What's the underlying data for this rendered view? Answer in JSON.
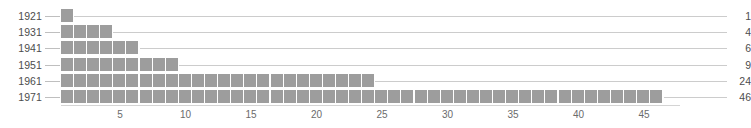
{
  "chart_data": {
    "type": "bar",
    "title": "",
    "subtitle": "",
    "xlabel": "",
    "ylabel": "",
    "orientation": "horizontal",
    "unit_square_chart": true,
    "categories": [
      "1921",
      "1931",
      "1941",
      "1951",
      "1961",
      "1971"
    ],
    "values": [
      1,
      4,
      6,
      9,
      24,
      46
    ],
    "value_labels": [
      "1",
      "4",
      "6",
      "9",
      "24",
      "46"
    ],
    "xlim": [
      0,
      47
    ],
    "x_ticks": [
      5,
      10,
      15,
      20,
      25,
      30,
      35,
      40,
      45
    ],
    "x_tick_labels": [
      "5",
      "10",
      "15",
      "20",
      "25",
      "30",
      "35",
      "40",
      "45"
    ],
    "grid": false,
    "legend": null,
    "series": [
      {
        "name": "count",
        "values": [
          1,
          4,
          6,
          9,
          24,
          46
        ]
      }
    ],
    "rows": [
      {
        "year": "1921",
        "count": 1,
        "label": "1"
      },
      {
        "year": "1931",
        "count": 4,
        "label": "4"
      },
      {
        "year": "1941",
        "count": 6,
        "label": "6"
      },
      {
        "year": "1951",
        "count": 9,
        "label": "9"
      },
      {
        "year": "1961",
        "count": 24,
        "label": "24"
      },
      {
        "year": "1971",
        "count": 46,
        "label": "46"
      }
    ]
  },
  "colors": {
    "square_fill": "#9d9d9d",
    "leader_line": "#cccccc",
    "axis_line": "#d4d4d4",
    "label_text": "#4d4d4d",
    "tick_text": "#6b6b6b",
    "background": "#ffffff"
  },
  "top_clipped_text": ""
}
